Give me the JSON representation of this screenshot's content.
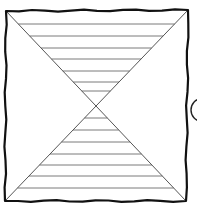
{
  "diagram": {
    "square": {
      "top_left": [
        6,
        11
      ],
      "top_right": [
        188,
        10
      ],
      "bottom_right": [
        186,
        201
      ],
      "bottom_left": [
        5,
        201
      ]
    },
    "center": [
      96,
      105
    ],
    "top_triangle_hatch_y": [
      24,
      36,
      48,
      59,
      71,
      82,
      91
    ],
    "bottom_triangle_hatch_y": [
      118,
      130,
      142,
      154,
      165,
      176,
      188
    ],
    "arc": {
      "cx": 200,
      "cy": 110,
      "r": 8
    },
    "colors": {
      "frame": "#111111",
      "diagonal": "#555555",
      "hatch": "#7a7a7a",
      "background": "#ffffff"
    }
  }
}
